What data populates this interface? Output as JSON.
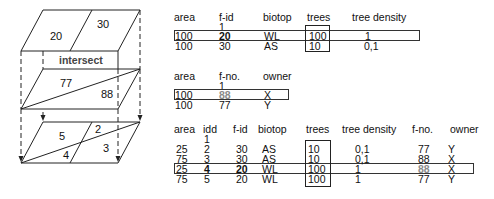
{
  "diagram": {
    "top_layer": {
      "labels": [
        "20",
        "30"
      ]
    },
    "operation_label": "intersect",
    "middle_layer": {
      "labels": [
        "77",
        "88"
      ]
    },
    "result_layer": {
      "labels": [
        "5",
        "2",
        "4",
        "3"
      ]
    }
  },
  "table1": {
    "headers": [
      "area",
      "f-id",
      "biotop",
      "trees",
      "tree density"
    ],
    "key_marker": "1",
    "rows": [
      [
        "100",
        "20",
        "WL",
        "100",
        "1"
      ],
      [
        "100",
        "30",
        "AS",
        "10",
        "0,1"
      ]
    ],
    "highlighted_row": 0,
    "highlighted_column": "trees"
  },
  "table2": {
    "headers": [
      "area",
      "f-no.",
      "owner"
    ],
    "key_marker": "1",
    "rows": [
      [
        "100",
        "88",
        "X"
      ],
      [
        "100",
        "77",
        "Y"
      ]
    ],
    "highlighted_row": 0
  },
  "table3": {
    "headers": [
      "area",
      "idd",
      "f-id",
      "biotop",
      "trees",
      "tree density",
      "f-no.",
      "owner"
    ],
    "key_marker": "1",
    "rows": [
      [
        "25",
        "2",
        "30",
        "AS",
        "10",
        "0,1",
        "77",
        "Y"
      ],
      [
        "75",
        "3",
        "30",
        "AS",
        "10",
        "0,1",
        "88",
        "X"
      ],
      [
        "25",
        "4",
        "20",
        "WL",
        "100",
        "1",
        "88",
        "X"
      ],
      [
        "75",
        "5",
        "20",
        "WL",
        "100",
        "1",
        "77",
        "Y"
      ]
    ],
    "highlighted_row": 2,
    "highlighted_column": "trees"
  },
  "colors": {
    "line": "#222222",
    "dimmed_text": "#8a8a8a"
  }
}
